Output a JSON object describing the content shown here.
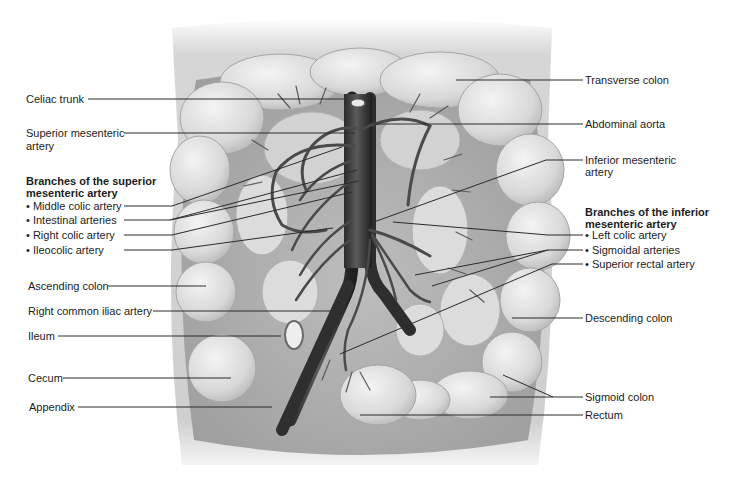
{
  "figure": {
    "colors": {
      "background": "#ffffff",
      "tissue_light": "#e6e6e6",
      "tissue_mid": "#c9c9c9",
      "tissue_dark": "#9a9a9a",
      "artery": "#3a3a3a",
      "leader_line": "#2a2a2a",
      "text": "#1c1c1c"
    }
  },
  "left_labels": {
    "celiac_trunk": "Celiac trunk",
    "superior_mesenteric_artery_l1": "Superior mesenteric",
    "superior_mesenteric_artery_l2": "artery",
    "sma_branches_header_l1": "Branches of the superior",
    "sma_branches_header_l2": "mesenteric artery",
    "sma_branches": [
      "Middle colic artery",
      "Intestinal arteries",
      "Right colic artery",
      "Ileocolic artery"
    ],
    "ascending_colon": "Ascending colon",
    "right_common_iliac_artery": "Right common iliac artery",
    "ileum": "Ileum",
    "cecum": "Cecum",
    "appendix": "Appendix"
  },
  "right_labels": {
    "transverse_colon": "Transverse colon",
    "abdominal_aorta": "Abdominal aorta",
    "inferior_mesenteric_artery_l1": "Inferior mesenteric",
    "inferior_mesenteric_artery_l2": "artery",
    "ima_branches_header_l1": "Branches of the inferior",
    "ima_branches_header_l2": "mesenteric artery",
    "ima_branches": [
      "Left colic artery",
      "Sigmoidal arteries",
      "Superior rectal artery"
    ],
    "descending_colon": "Descending colon",
    "sigmoid_colon": "Sigmoid colon",
    "rectum": "Rectum"
  }
}
